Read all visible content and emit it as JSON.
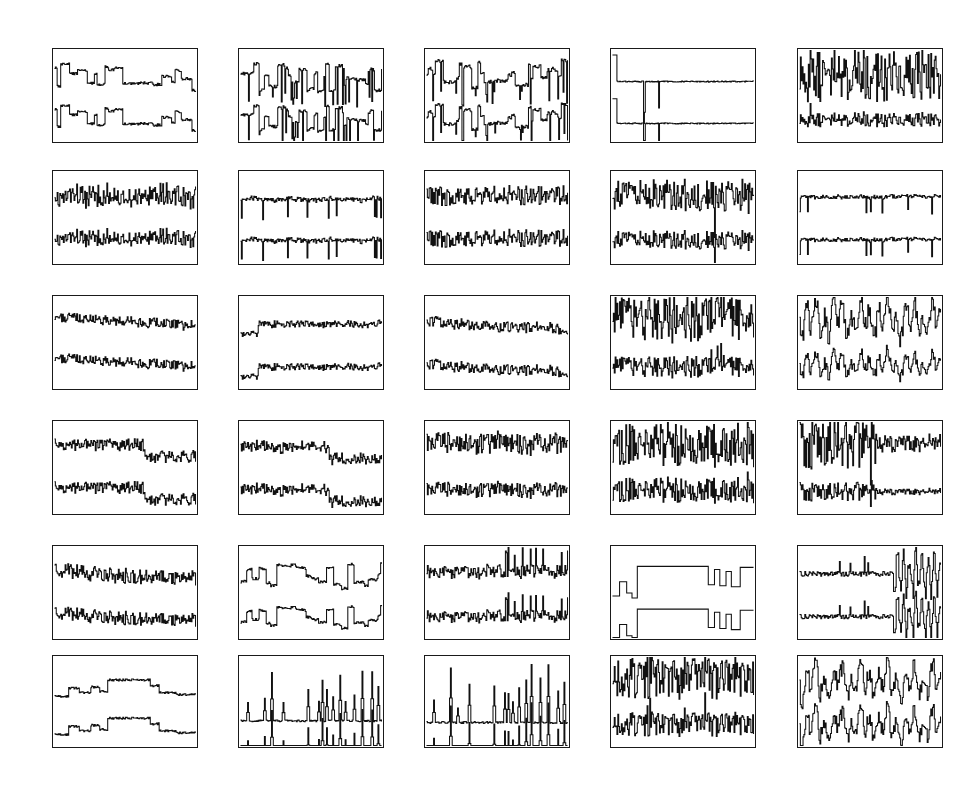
{
  "figure": {
    "title": "",
    "kind": "signal-panel-grid",
    "background_color": "#ffffff",
    "line_color": "#111111",
    "border_color": "#1a1a1a",
    "rows": 6,
    "columns": 5,
    "panel_count": 30,
    "traces_per_panel": 2,
    "trace_roles": [
      "observed-signal",
      "reconstructed-signal"
    ]
  },
  "layout": {
    "canvas_width": 971,
    "canvas_height": 793,
    "column_x": [
      52,
      238,
      424,
      610,
      797
    ],
    "row_y": [
      48,
      170,
      295,
      420,
      545,
      655
    ],
    "panel_width": 146,
    "panel_height": 95,
    "panel_height_last_row": 93
  },
  "chart_data": {
    "type": "line",
    "title": "",
    "subtitle": "",
    "xlabel": "",
    "ylabel": "",
    "grid": false,
    "legend": null,
    "axis_ticks": false,
    "xlim": [
      0,
      1
    ],
    "ylim": [
      0,
      1
    ],
    "n_samples": 160,
    "panels": [
      {
        "id": "r1c1",
        "row": 1,
        "col": 1,
        "signal_class": "piecewise-constant-blocks",
        "top": {
          "baseline": 0.3,
          "amplitude": 0.17,
          "seed": 11,
          "spikiness": 0.1
        },
        "bottom": {
          "baseline": 0.74,
          "amplitude": 0.16,
          "seed": 11,
          "spikiness": 0.08
        }
      },
      {
        "id": "r1c2",
        "row": 1,
        "col": 2,
        "signal_class": "blocks-with-impulses",
        "top": {
          "baseline": 0.3,
          "amplitude": 0.22,
          "seed": 23,
          "spikiness": 0.55
        },
        "bottom": {
          "baseline": 0.74,
          "amplitude": 0.2,
          "seed": 23,
          "spikiness": 0.5
        }
      },
      {
        "id": "r1c3",
        "row": 1,
        "col": 3,
        "signal_class": "blocks-with-impulses",
        "top": {
          "baseline": 0.26,
          "amplitude": 0.24,
          "seed": 37,
          "spikiness": 0.6
        },
        "bottom": {
          "baseline": 0.72,
          "amplitude": 0.22,
          "seed": 37,
          "spikiness": 0.55
        }
      },
      {
        "id": "r1c4",
        "row": 1,
        "col": 4,
        "signal_class": "single-step-with-two-spikes",
        "top": {
          "baseline": 0.35,
          "amplitude": 0.3,
          "seed": 41,
          "spikiness": 0.95
        },
        "bottom": {
          "baseline": 0.8,
          "amplitude": 0.28,
          "seed": 41,
          "spikiness": 0.95
        }
      },
      {
        "id": "r1c5",
        "row": 1,
        "col": 5,
        "signal_class": "high-variance-noise",
        "top": {
          "baseline": 0.28,
          "amplitude": 0.3,
          "seed": 53,
          "spikiness": 0.3
        },
        "bottom": {
          "baseline": 0.76,
          "amplitude": 0.08,
          "seed": 53,
          "spikiness": 0.15
        }
      },
      {
        "id": "r2c1",
        "row": 2,
        "col": 1,
        "signal_class": "dense-noise-drift",
        "top": {
          "baseline": 0.27,
          "amplitude": 0.22,
          "seed": 61,
          "spikiness": 0.18
        },
        "bottom": {
          "baseline": 0.72,
          "amplitude": 0.16,
          "seed": 61,
          "spikiness": 0.12
        }
      },
      {
        "id": "r2c2",
        "row": 2,
        "col": 2,
        "signal_class": "smooth-with-dropouts",
        "top": {
          "baseline": 0.3,
          "amplitude": 0.13,
          "seed": 73,
          "spikiness": 0.35
        },
        "bottom": {
          "baseline": 0.74,
          "amplitude": 0.13,
          "seed": 73,
          "spikiness": 0.33
        }
      },
      {
        "id": "r2c3",
        "row": 2,
        "col": 3,
        "signal_class": "dense-noise-drift",
        "top": {
          "baseline": 0.26,
          "amplitude": 0.18,
          "seed": 83,
          "spikiness": 0.2
        },
        "bottom": {
          "baseline": 0.72,
          "amplitude": 0.16,
          "seed": 83,
          "spikiness": 0.18
        }
      },
      {
        "id": "r2c4",
        "row": 2,
        "col": 4,
        "signal_class": "noisy-with-vertical-spike",
        "top": {
          "baseline": 0.26,
          "amplitude": 0.24,
          "seed": 97,
          "spikiness": 0.45
        },
        "bottom": {
          "baseline": 0.74,
          "amplitude": 0.14,
          "seed": 97,
          "spikiness": 0.3
        }
      },
      {
        "id": "r2c5",
        "row": 2,
        "col": 5,
        "signal_class": "smooth-with-dropouts",
        "top": {
          "baseline": 0.28,
          "amplitude": 0.11,
          "seed": 103,
          "spikiness": 0.32
        },
        "bottom": {
          "baseline": 0.74,
          "amplitude": 0.11,
          "seed": 103,
          "spikiness": 0.3
        }
      },
      {
        "id": "r3c1",
        "row": 3,
        "col": 1,
        "signal_class": "noise-rising-trend",
        "top": {
          "baseline": 0.32,
          "amplitude": 0.14,
          "seed": 113,
          "spikiness": 0.16
        },
        "bottom": {
          "baseline": 0.76,
          "amplitude": 0.14,
          "seed": 113,
          "spikiness": 0.14
        }
      },
      {
        "id": "r3c2",
        "row": 3,
        "col": 2,
        "signal_class": "step-up-then-flat-noise",
        "top": {
          "baseline": 0.3,
          "amplitude": 0.12,
          "seed": 127,
          "spikiness": 0.22
        },
        "bottom": {
          "baseline": 0.76,
          "amplitude": 0.12,
          "seed": 127,
          "spikiness": 0.2
        }
      },
      {
        "id": "r3c3",
        "row": 3,
        "col": 3,
        "signal_class": "noise-falling-trend",
        "top": {
          "baseline": 0.28,
          "amplitude": 0.14,
          "seed": 139,
          "spikiness": 0.18
        },
        "bottom": {
          "baseline": 0.74,
          "amplitude": 0.14,
          "seed": 139,
          "spikiness": 0.16
        }
      },
      {
        "id": "r3c4",
        "row": 3,
        "col": 4,
        "signal_class": "high-variance-noise",
        "top": {
          "baseline": 0.24,
          "amplitude": 0.26,
          "seed": 149,
          "spikiness": 0.35
        },
        "bottom": {
          "baseline": 0.76,
          "amplitude": 0.12,
          "seed": 149,
          "spikiness": 0.3
        }
      },
      {
        "id": "r3c5",
        "row": 3,
        "col": 5,
        "signal_class": "oscillatory-high-frequency",
        "top": {
          "baseline": 0.25,
          "amplitude": 0.26,
          "seed": 157,
          "spikiness": 0.28
        },
        "bottom": {
          "baseline": 0.74,
          "amplitude": 0.16,
          "seed": 157,
          "spikiness": 0.22
        }
      },
      {
        "id": "r4c1",
        "row": 4,
        "col": 1,
        "signal_class": "noise-with-level-drop",
        "top": {
          "baseline": 0.26,
          "amplitude": 0.16,
          "seed": 167,
          "spikiness": 0.2
        },
        "bottom": {
          "baseline": 0.72,
          "amplitude": 0.16,
          "seed": 167,
          "spikiness": 0.18
        }
      },
      {
        "id": "r4c2",
        "row": 4,
        "col": 2,
        "signal_class": "noise-with-level-drop",
        "top": {
          "baseline": 0.28,
          "amplitude": 0.15,
          "seed": 179,
          "spikiness": 0.22
        },
        "bottom": {
          "baseline": 0.74,
          "amplitude": 0.15,
          "seed": 179,
          "spikiness": 0.2
        }
      },
      {
        "id": "r4c3",
        "row": 4,
        "col": 3,
        "signal_class": "dense-noise-drift",
        "top": {
          "baseline": 0.24,
          "amplitude": 0.2,
          "seed": 191,
          "spikiness": 0.22
        },
        "bottom": {
          "baseline": 0.74,
          "amplitude": 0.14,
          "seed": 191,
          "spikiness": 0.18
        }
      },
      {
        "id": "r4c4",
        "row": 4,
        "col": 4,
        "signal_class": "high-variance-noise",
        "top": {
          "baseline": 0.25,
          "amplitude": 0.24,
          "seed": 197,
          "spikiness": 0.3
        },
        "bottom": {
          "baseline": 0.74,
          "amplitude": 0.14,
          "seed": 197,
          "spikiness": 0.25
        }
      },
      {
        "id": "r4c5",
        "row": 4,
        "col": 5,
        "signal_class": "burst-then-quiet",
        "top": {
          "baseline": 0.24,
          "amplitude": 0.28,
          "seed": 211,
          "spikiness": 0.55
        },
        "bottom": {
          "baseline": 0.76,
          "amplitude": 0.1,
          "seed": 211,
          "spikiness": 0.25
        }
      },
      {
        "id": "r5c1",
        "row": 5,
        "col": 1,
        "signal_class": "noise-falling-trend",
        "top": {
          "baseline": 0.26,
          "amplitude": 0.2,
          "seed": 223,
          "spikiness": 0.26
        },
        "bottom": {
          "baseline": 0.72,
          "amplitude": 0.18,
          "seed": 223,
          "spikiness": 0.24
        }
      },
      {
        "id": "r5c2",
        "row": 5,
        "col": 2,
        "signal_class": "piecewise-constant-blocks",
        "top": {
          "baseline": 0.34,
          "amplitude": 0.18,
          "seed": 233,
          "spikiness": 0.12
        },
        "bottom": {
          "baseline": 0.78,
          "amplitude": 0.16,
          "seed": 233,
          "spikiness": 0.1
        }
      },
      {
        "id": "r5c3",
        "row": 5,
        "col": 3,
        "signal_class": "noise-with-late-peaks",
        "top": {
          "baseline": 0.28,
          "amplitude": 0.2,
          "seed": 241,
          "spikiness": 0.4
        },
        "bottom": {
          "baseline": 0.76,
          "amplitude": 0.18,
          "seed": 241,
          "spikiness": 0.38
        }
      },
      {
        "id": "r5c4",
        "row": 5,
        "col": 4,
        "signal_class": "square-wave-steps",
        "top": {
          "baseline": 0.34,
          "amplitude": 0.22,
          "seed": 251,
          "spikiness": 0.05
        },
        "bottom": {
          "baseline": 0.8,
          "amplitude": 0.22,
          "seed": 251,
          "spikiness": 0.05
        }
      },
      {
        "id": "r5c5",
        "row": 5,
        "col": 5,
        "signal_class": "quiet-then-late-burst",
        "top": {
          "baseline": 0.3,
          "amplitude": 0.22,
          "seed": 263,
          "spikiness": 0.5
        },
        "bottom": {
          "baseline": 0.76,
          "amplitude": 0.2,
          "seed": 263,
          "spikiness": 0.48
        }
      },
      {
        "id": "r6c1",
        "row": 6,
        "col": 1,
        "signal_class": "smooth-plateau",
        "top": {
          "baseline": 0.34,
          "amplitude": 0.14,
          "seed": 271,
          "spikiness": 0.06
        },
        "bottom": {
          "baseline": 0.76,
          "amplitude": 0.14,
          "seed": 271,
          "spikiness": 0.06
        }
      },
      {
        "id": "r6c2",
        "row": 6,
        "col": 2,
        "signal_class": "sparse-impulse-train",
        "top": {
          "baseline": 0.4,
          "amplitude": 0.34,
          "seed": 281,
          "spikiness": 0.92
        },
        "bottom": {
          "baseline": 0.82,
          "amplitude": 0.34,
          "seed": 281,
          "spikiness": 0.92
        }
      },
      {
        "id": "r6c3",
        "row": 6,
        "col": 3,
        "signal_class": "sparse-impulse-train",
        "top": {
          "baseline": 0.4,
          "amplitude": 0.36,
          "seed": 293,
          "spikiness": 0.95
        },
        "bottom": {
          "baseline": 0.82,
          "amplitude": 0.36,
          "seed": 293,
          "spikiness": 0.95
        }
      },
      {
        "id": "r6c4",
        "row": 6,
        "col": 4,
        "signal_class": "high-variance-noise",
        "top": {
          "baseline": 0.26,
          "amplitude": 0.24,
          "seed": 307,
          "spikiness": 0.28
        },
        "bottom": {
          "baseline": 0.76,
          "amplitude": 0.14,
          "seed": 307,
          "spikiness": 0.22
        }
      },
      {
        "id": "r6c5",
        "row": 6,
        "col": 5,
        "signal_class": "oscillatory-high-frequency",
        "top": {
          "baseline": 0.28,
          "amplitude": 0.22,
          "seed": 317,
          "spikiness": 0.24
        },
        "bottom": {
          "baseline": 0.76,
          "amplitude": 0.2,
          "seed": 317,
          "spikiness": 0.22
        }
      }
    ]
  }
}
